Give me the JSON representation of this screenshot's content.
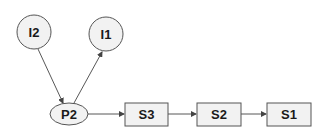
{
  "diagram": {
    "type": "flow-graph",
    "nodes": [
      {
        "id": "I2",
        "label": "I2",
        "shape": "circle"
      },
      {
        "id": "I1",
        "label": "I1",
        "shape": "circle"
      },
      {
        "id": "P2",
        "label": "P2",
        "shape": "ellipse"
      },
      {
        "id": "S3",
        "label": "S3",
        "shape": "rectangle"
      },
      {
        "id": "S2",
        "label": "S2",
        "shape": "rectangle"
      },
      {
        "id": "S1",
        "label": "S1",
        "shape": "rectangle"
      }
    ],
    "edges": [
      {
        "from": "I2",
        "to": "P2"
      },
      {
        "from": "P2",
        "to": "I1"
      },
      {
        "from": "P2",
        "to": "S3"
      },
      {
        "from": "S3",
        "to": "S2"
      },
      {
        "from": "S2",
        "to": "S1"
      }
    ],
    "colors": {
      "node_fill": "#f2f2f2",
      "node_stroke": "#555555",
      "edge": "#444444",
      "text": "#1a1a1a"
    }
  }
}
